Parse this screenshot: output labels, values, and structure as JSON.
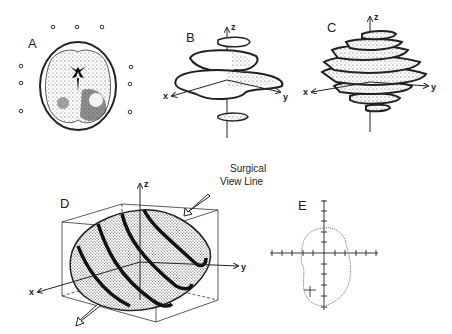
{
  "figure": {
    "panels": [
      {
        "id": "A",
        "label": "A",
        "description": "Axial CT slice of brain with fiducial markers"
      },
      {
        "id": "B",
        "label": "B",
        "description": "Stacked tumor contour slices in 3D axes",
        "axes": {
          "x": "x",
          "y": "y",
          "z": "z"
        }
      },
      {
        "id": "C",
        "label": "C",
        "description": "Dense stacked tumor contour reconstruction",
        "axes": {
          "x": "x",
          "y": "y",
          "z": "z"
        }
      },
      {
        "id": "D",
        "label": "D",
        "description": "Tumor volume in bounding box with surgical view line",
        "axes": {
          "x": "x",
          "y": "y",
          "z": "z"
        },
        "annotation_line1": "Surgical",
        "annotation_line2": "View Line"
      },
      {
        "id": "E",
        "label": "E",
        "description": "Tumor outline slice on crosshair grid"
      }
    ]
  },
  "colors": {
    "ink": "#222222",
    "background": "#ffffff",
    "stipple": "#555555"
  }
}
